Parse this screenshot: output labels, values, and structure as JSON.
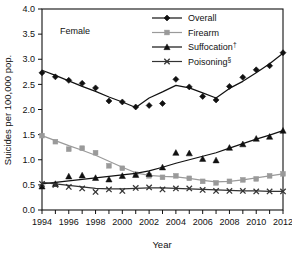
{
  "chart_data": {
    "type": "line",
    "title": "",
    "panel_label": "Female",
    "xlabel": "Year",
    "ylabel": "Suicides per 100,000 pop.",
    "xlim": [
      1994,
      2012
    ],
    "ylim": [
      0.0,
      4.0
    ],
    "grid": false,
    "legend_position": "top-right",
    "x": [
      1994,
      1995,
      1996,
      1997,
      1998,
      1999,
      2000,
      2001,
      2002,
      2003,
      2004,
      2005,
      2006,
      2007,
      2008,
      2009,
      2010,
      2011,
      2012
    ],
    "xticks": [
      1994,
      1995,
      1996,
      1997,
      1998,
      1999,
      2000,
      2001,
      2002,
      2003,
      2004,
      2005,
      2006,
      2007,
      2008,
      2009,
      2010,
      2011,
      2012
    ],
    "xtick_labels": [
      "1994",
      "",
      "1996",
      "",
      "1998",
      "",
      "2000",
      "",
      "2002",
      "",
      "2004",
      "",
      "2006",
      "",
      "2008",
      "",
      "2010",
      "",
      "2012"
    ],
    "yticks": [
      0.0,
      0.5,
      1.0,
      1.5,
      2.0,
      2.5,
      3.0,
      3.5,
      4.0
    ],
    "ytick_labels": [
      "0.0",
      "0.5",
      "1.0",
      "1.5",
      "2.0",
      "2.5",
      "3.0",
      "3.5",
      "4.0"
    ],
    "series": [
      {
        "name": "Overall",
        "legend_label": "Overall",
        "legend_sup": "",
        "marker": "diamond",
        "color": "#111111",
        "values": [
          2.73,
          2.65,
          2.58,
          2.52,
          2.43,
          2.17,
          2.15,
          2.05,
          2.08,
          2.12,
          2.6,
          2.45,
          2.26,
          2.19,
          2.46,
          2.64,
          2.79,
          2.87,
          3.13
        ],
        "trend": [
          2.78,
          2.68,
          2.57,
          2.46,
          2.36,
          2.25,
          2.15,
          2.04,
          2.23,
          2.35,
          2.48,
          2.43,
          2.33,
          2.23,
          2.42,
          2.56,
          2.73,
          2.91,
          3.12
        ]
      },
      {
        "name": "Firearm",
        "legend_label": "Firearm",
        "legend_sup": "",
        "marker": "square",
        "color": "#9a9a9a",
        "values": [
          1.48,
          1.36,
          1.21,
          1.23,
          1.14,
          0.88,
          0.83,
          0.71,
          0.68,
          0.65,
          0.68,
          0.63,
          0.57,
          0.54,
          0.57,
          0.6,
          0.62,
          0.68,
          0.72
        ],
        "trend": [
          1.48,
          1.38,
          1.28,
          1.19,
          1.09,
          0.97,
          0.85,
          0.74,
          0.69,
          0.67,
          0.66,
          0.63,
          0.59,
          0.56,
          0.57,
          0.6,
          0.64,
          0.68,
          0.72
        ]
      },
      {
        "name": "Suffocation",
        "legend_label": "Suffocation",
        "legend_sup": "†",
        "marker": "triangle",
        "color": "#111111",
        "values": [
          0.47,
          0.52,
          0.67,
          0.69,
          0.64,
          0.61,
          0.68,
          0.7,
          0.72,
          0.85,
          1.14,
          1.13,
          1.02,
          0.99,
          1.24,
          1.31,
          1.42,
          1.46,
          1.58
        ],
        "trend": [
          0.52,
          0.55,
          0.58,
          0.61,
          0.64,
          0.67,
          0.7,
          0.73,
          0.78,
          0.85,
          0.93,
          1.0,
          1.07,
          1.14,
          1.23,
          1.32,
          1.41,
          1.49,
          1.58
        ]
      },
      {
        "name": "Poisoning",
        "legend_label": "Poisoning",
        "legend_sup": "§",
        "marker": "cross",
        "color": "#333333",
        "values": [
          0.52,
          0.5,
          0.46,
          0.43,
          0.36,
          0.41,
          0.38,
          0.44,
          0.45,
          0.41,
          0.43,
          0.43,
          0.4,
          0.38,
          0.38,
          0.38,
          0.37,
          0.37,
          0.37
        ],
        "trend": [
          0.55,
          0.52,
          0.49,
          0.46,
          0.43,
          0.42,
          0.42,
          0.43,
          0.44,
          0.44,
          0.43,
          0.42,
          0.41,
          0.4,
          0.39,
          0.38,
          0.38,
          0.37,
          0.37
        ]
      }
    ]
  }
}
